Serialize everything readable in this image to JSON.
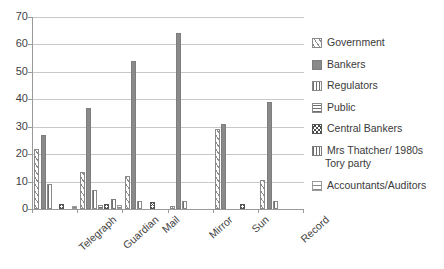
{
  "chart_data": {
    "type": "bar",
    "title": "",
    "xlabel": "",
    "ylabel": "",
    "ylim": [
      0,
      70
    ],
    "ytick_step": 10,
    "ytick_labels": [
      "0",
      "10",
      "20",
      "30",
      "40",
      "50",
      "60",
      "70"
    ],
    "grid": true,
    "legend_position": "right",
    "categories": [
      "Telegraph",
      "Guardian",
      "Mail",
      "Mirror",
      "Sun",
      "Record"
    ],
    "series": [
      {
        "name": "Government",
        "key": "government",
        "values": [
          22,
          13.5,
          12,
          1,
          29,
          10.5
        ]
      },
      {
        "name": "Bankers",
        "key": "bankers",
        "values": [
          27,
          37,
          54,
          64,
          31,
          39
        ]
      },
      {
        "name": "Regulators",
        "key": "regulators",
        "values": [
          9,
          7,
          3,
          3,
          0,
          3
        ]
      },
      {
        "name": "Public",
        "key": "public",
        "values": [
          0,
          1.5,
          0,
          0,
          0,
          0
        ]
      },
      {
        "name": "Central Bankers",
        "key": "central-bankers",
        "values": [
          2,
          2,
          2.5,
          0,
          2,
          0
        ]
      },
      {
        "name": "Mrs Thatcher/ 1980s Tory party",
        "key": "thatcher",
        "values": [
          0,
          3.5,
          0,
          0,
          0,
          0
        ]
      },
      {
        "name": "Accountants/Auditors",
        "key": "accountants",
        "values": [
          1,
          1.5,
          0,
          0,
          0,
          0
        ]
      }
    ]
  },
  "legend": {
    "entries": [
      {
        "label": "Government",
        "key": "government"
      },
      {
        "label": "Bankers",
        "key": "bankers"
      },
      {
        "label": "Regulators",
        "key": "regulators"
      },
      {
        "label": "Public",
        "key": "public"
      },
      {
        "label": "Central Bankers",
        "key": "central-bankers"
      },
      {
        "label": "Mrs Thatcher/ 1980s",
        "key": "thatcher",
        "cont": "Tory party"
      },
      {
        "label": "Accountants/Auditors",
        "key": "accountants"
      }
    ]
  },
  "colors": {
    "axis": "#9a9a9a",
    "grid": "#c8c8c8",
    "bar_solid": "#8a8a8a",
    "text": "#3a3a3a",
    "background": "#ffffff"
  }
}
